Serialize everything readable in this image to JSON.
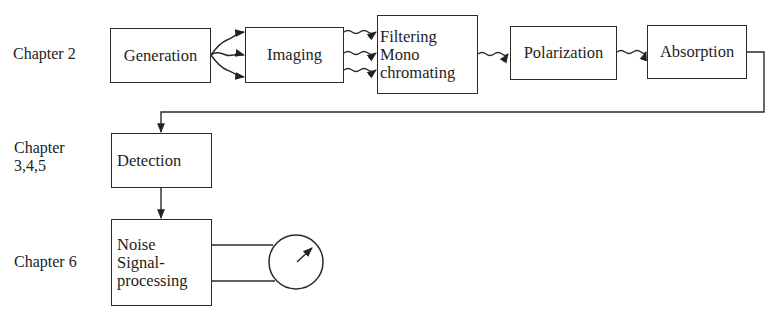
{
  "diagram": {
    "type": "block-flow",
    "chapter_labels": [
      {
        "id": "ch2",
        "text_lines": [
          "Chapter 2"
        ]
      },
      {
        "id": "ch345",
        "text_lines": [
          "Chapter",
          "3,4,5"
        ]
      },
      {
        "id": "ch6",
        "text_lines": [
          "Chapter 6"
        ]
      }
    ],
    "blocks": [
      {
        "id": "generation",
        "lines": [
          "Generation"
        ],
        "chapter": "Chapter 2"
      },
      {
        "id": "imaging",
        "lines": [
          "Imaging"
        ],
        "chapter": "Chapter 2"
      },
      {
        "id": "filtering",
        "lines": [
          "Filtering",
          "Mono",
          "chromating"
        ],
        "chapter": "Chapter 2"
      },
      {
        "id": "polarization",
        "lines": [
          "Polarization"
        ],
        "chapter": "Chapter 2"
      },
      {
        "id": "absorption",
        "lines": [
          "Absorption"
        ],
        "chapter": "Chapter 2"
      },
      {
        "id": "detection",
        "lines": [
          "Detection"
        ],
        "chapter": "Chapter 3,4,5"
      },
      {
        "id": "noise",
        "lines": [
          "Noise",
          "Signal-",
          "processing"
        ],
        "chapter": "Chapter 6"
      }
    ],
    "connections": [
      {
        "from": "generation",
        "to": "imaging",
        "style": "wavy",
        "count": 3
      },
      {
        "from": "imaging",
        "to": "filtering",
        "style": "wavy",
        "count": 3
      },
      {
        "from": "filtering",
        "to": "polarization",
        "style": "wavy",
        "count": 1
      },
      {
        "from": "polarization",
        "to": "absorption",
        "style": "wavy",
        "count": 1
      },
      {
        "from": "absorption",
        "to": "detection",
        "style": "straight-elbow",
        "count": 1
      },
      {
        "from": "detection",
        "to": "noise",
        "style": "straight",
        "count": 1
      },
      {
        "from": "noise",
        "to": "meter",
        "style": "two-wire",
        "count": 2
      }
    ],
    "meter": {
      "id": "meter",
      "symbol": "analog-dial"
    }
  }
}
